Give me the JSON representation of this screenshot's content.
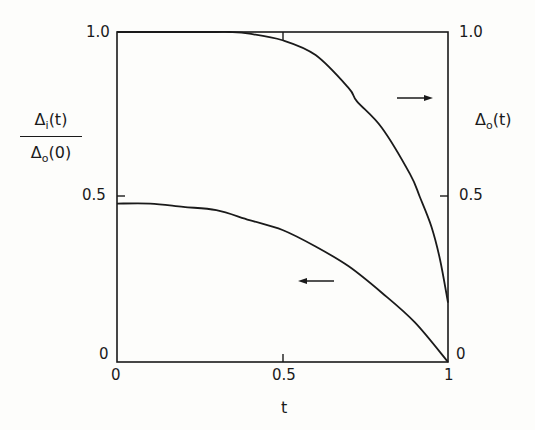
{
  "chart_data": {
    "type": "line",
    "title": "",
    "xlabel": "t",
    "ylabel_left": "Δi(t) / Δo(0)",
    "ylabel_right": "Δo(t)",
    "xlim": [
      0,
      1
    ],
    "ylim_left": [
      0,
      1
    ],
    "ylim_right": [
      0,
      1
    ],
    "x_ticks": [
      "0",
      "0.5",
      "1"
    ],
    "y_ticks_left": [
      "0",
      "0.5",
      "1.0"
    ],
    "y_ticks_right": [
      "0",
      "0.5",
      "1.0"
    ],
    "grid": false,
    "series": [
      {
        "name": "Δo(t)",
        "axis": "right",
        "annotation": "arrow pointing right",
        "x": [
          0,
          0.1,
          0.2,
          0.3,
          0.34,
          0.4,
          0.5,
          0.6,
          0.7,
          0.725,
          0.8,
          0.885,
          0.915,
          0.95,
          0.976,
          1.0
        ],
        "y": [
          1.0,
          1.0,
          1.0,
          1.0,
          1.0,
          0.995,
          0.975,
          0.93,
          0.83,
          0.79,
          0.71,
          0.57,
          0.5,
          0.41,
          0.31,
          0.18
        ]
      },
      {
        "name": "Δi(t)/Δo(0)",
        "axis": "left",
        "annotation": "arrow pointing left",
        "x": [
          0,
          0.1,
          0.2,
          0.3,
          0.4,
          0.5,
          0.6,
          0.7,
          0.8,
          0.9,
          1.0
        ],
        "y": [
          0.48,
          0.48,
          0.47,
          0.46,
          0.43,
          0.4,
          0.35,
          0.29,
          0.21,
          0.12,
          0.0
        ]
      }
    ]
  },
  "labels": {
    "left_num": "Δ",
    "left_num_sub": "i",
    "left_num_arg": "(t)",
    "left_den": "Δ",
    "left_den_sub": "o",
    "left_den_arg": "(0)",
    "right": "Δ",
    "right_sub": "o",
    "right_arg": "(t)",
    "x_axis": "t",
    "yl_1": "1.0",
    "yl_05": "0.5",
    "yl_0": "0",
    "yr_1": "1.0",
    "yr_05": "0.5",
    "yr_0": "0",
    "x_0": "0",
    "x_05": "0.5",
    "x_1": "1"
  }
}
